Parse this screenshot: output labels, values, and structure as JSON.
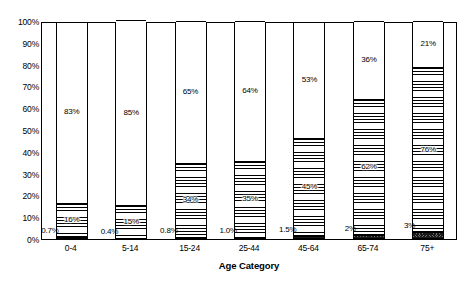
{
  "chart_data": {
    "type": "bar",
    "subtype": "stacked-bar-100",
    "title": "",
    "xlabel": "Age Category",
    "ylabel": "",
    "ylim": [
      0,
      100
    ],
    "grid": false,
    "legend": "none",
    "categories": [
      "0-4",
      "5-14",
      "15-24",
      "25-44",
      "45-64",
      "65-74",
      "75+"
    ],
    "ytick_labels": [
      "0%",
      "10%",
      "20%",
      "30%",
      "40%",
      "50%",
      "60%",
      "70%",
      "80%",
      "90%",
      "100%"
    ],
    "ytick_values": [
      0,
      10,
      20,
      30,
      40,
      50,
      60,
      70,
      80,
      90,
      100
    ],
    "series": [
      {
        "name": "bottom-segment",
        "pattern": "dark-checker",
        "values": [
          0.7,
          0.4,
          0.8,
          1.0,
          1.5,
          2,
          3
        ],
        "labels": [
          "0.7%",
          "0.4%",
          "0.8%",
          "1.0%",
          "1.5%",
          "2%",
          "3%"
        ],
        "label_position": [
          "left",
          "left",
          "left",
          "left",
          "left",
          "left",
          "left"
        ]
      },
      {
        "name": "middle-segment",
        "pattern": "horizontal-lines",
        "values": [
          16,
          15,
          34,
          35,
          45,
          62,
          76
        ],
        "labels": [
          "16%",
          "15%",
          "34%",
          "35%",
          "45%",
          "62%",
          "76%"
        ],
        "label_position": [
          "center",
          "center",
          "center",
          "center",
          "center",
          "center",
          "center"
        ]
      },
      {
        "name": "top-segment",
        "pattern": "dots",
        "values": [
          83,
          85,
          65,
          64,
          53,
          36,
          21
        ],
        "labels": [
          "83%",
          "85%",
          "65%",
          "64%",
          "53%",
          "36%",
          "21%"
        ],
        "label_position": [
          "center",
          "center",
          "center",
          "center",
          "center",
          "center",
          "center"
        ]
      }
    ]
  }
}
